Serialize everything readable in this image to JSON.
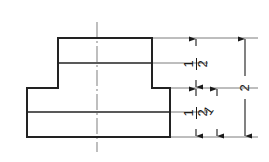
{
  "drawing": {
    "title": "Stepped Block Front View",
    "type": "orthographic-front-view",
    "units": "inches",
    "line_color": "#222222",
    "center_line_color": "#7a7a7a",
    "extension_line_color": "#6e6e6e",
    "background": "#ffffff",
    "object": {
      "name": "stepped-block",
      "upper_block": {
        "label": "upper-block",
        "left_x": 58,
        "right_x": 152,
        "top_y": 38,
        "bottom_y": 88,
        "divider_y": 63
      },
      "base_block": {
        "label": "base-block",
        "left_x": 27,
        "right_x": 170,
        "top_y": 88,
        "bottom_y": 137,
        "divider_y": 112
      }
    },
    "center_line": {
      "label": "vertical-center-line",
      "x": 97,
      "top_y": 22,
      "bottom_y": 152
    },
    "dimensions": [
      {
        "id": "upper-half",
        "value": "1/2",
        "numerator": "1",
        "denominator": "2",
        "orientation": "vertical",
        "text_x": 196,
        "text_y": 75,
        "line_x": 196,
        "from_y": 38,
        "to_y": 88
      },
      {
        "id": "lower-half",
        "value": "1/2",
        "numerator": "1",
        "denominator": "2",
        "orientation": "vertical",
        "text_x": 196,
        "text_y": 124,
        "line_x": 196,
        "from_y": 88,
        "to_y": 137
      },
      {
        "id": "base-thickness",
        "value": "1",
        "numerator": "1",
        "denominator": "",
        "orientation": "vertical",
        "text_x": 217,
        "text_y": 112,
        "line_x": 217,
        "from_y": 88,
        "to_y": 137
      },
      {
        "id": "overall-height",
        "value": "2",
        "numerator": "2",
        "denominator": "",
        "orientation": "vertical",
        "text_x": 245,
        "text_y": 87,
        "line_x": 245,
        "from_y": 38,
        "to_y": 137
      }
    ],
    "extension_lines": [
      {
        "id": "ext-top",
        "y": 38,
        "from_x": 152,
        "to_x": 258
      },
      {
        "id": "ext-upper-mid",
        "y": 63,
        "from_x": 152,
        "to_x": 208
      },
      {
        "id": "ext-step",
        "y": 88,
        "from_x": 170,
        "to_x": 258
      },
      {
        "id": "ext-base-mid",
        "y": 112,
        "from_x": 170,
        "to_x": 208
      },
      {
        "id": "ext-bottom",
        "y": 137,
        "from_x": 170,
        "to_x": 258
      }
    ]
  }
}
